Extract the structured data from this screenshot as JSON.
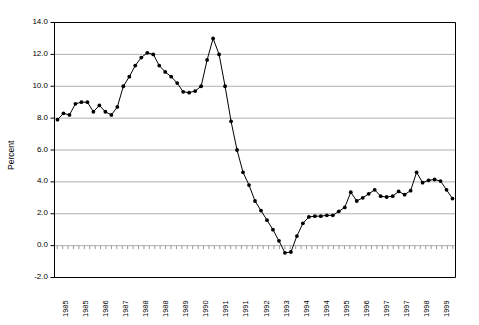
{
  "chart_data": {
    "type": "line",
    "title": "",
    "subtitle": "",
    "xlabel": "",
    "ylabel": "Percent",
    "ylim": [
      -2.0,
      14.0
    ],
    "yticks": [
      -2.0,
      0.0,
      2.0,
      4.0,
      6.0,
      8.0,
      10.0,
      12.0,
      14.0
    ],
    "ytick_labels": [
      "-2.0",
      "0.0",
      "2.0",
      "4.0",
      "6.0",
      "8.0",
      "10.0",
      "12.0",
      "14.0"
    ],
    "grid": true,
    "grid_axis": "y",
    "legend": false,
    "legend_position": "none",
    "marker": "filled-circle",
    "line_color": "#000000",
    "marker_color": "#000000",
    "grid_color": "#b0b0b0",
    "axis_color": "#000000",
    "plot_background": "#ffffff",
    "xtick_labels": [
      "1985",
      "1985",
      "1986",
      "1987",
      "1988",
      "1988",
      "1989",
      "1990",
      "1991",
      "1991",
      "1992",
      "1993",
      "1994",
      "1994",
      "1995",
      "1996",
      "1997",
      "1997",
      "1998",
      "1999"
    ],
    "n_points": 60,
    "values": [
      7.9,
      8.3,
      8.2,
      8.9,
      9.0,
      9.0,
      8.4,
      8.8,
      8.4,
      8.2,
      8.7,
      10.0,
      10.6,
      11.3,
      11.8,
      12.1,
      12.0,
      11.3,
      10.9,
      10.6,
      10.2,
      9.65,
      9.6,
      9.7,
      10.0,
      11.65,
      13.0,
      12.0,
      10.0,
      7.8,
      6.0,
      4.6,
      3.8,
      2.8,
      2.2,
      1.6,
      1.0,
      0.3,
      -0.45,
      -0.4,
      0.6,
      1.4,
      1.8,
      1.85,
      1.85,
      1.9,
      1.9,
      2.15,
      2.4,
      3.35,
      2.8,
      3.0,
      3.25,
      3.5,
      3.1,
      3.05,
      3.1,
      3.4,
      3.2,
      3.45
    ],
    "extended_values": [
      4.6,
      3.95,
      4.1,
      4.15,
      4.05,
      3.5,
      2.95
    ],
    "series": [
      {
        "name": "Percent",
        "values": [
          7.9,
          8.3,
          8.2,
          8.9,
          9.0,
          9.0,
          8.4,
          8.8,
          8.4,
          8.2,
          8.7,
          10.0,
          10.6,
          11.3,
          11.8,
          12.1,
          12.0,
          11.3,
          10.9,
          10.6,
          10.2,
          9.65,
          9.6,
          9.7,
          10.0,
          11.65,
          13.0,
          12.0,
          10.0,
          7.8,
          6.0,
          4.6,
          3.8,
          2.8,
          2.2,
          1.6,
          1.0,
          0.3,
          -0.45,
          -0.4,
          0.6,
          1.4,
          1.8,
          1.85,
          1.85,
          1.9,
          1.9,
          2.15,
          2.4,
          3.35,
          2.8,
          3.0,
          3.25,
          3.5,
          3.1,
          3.05,
          3.1,
          3.4,
          3.2,
          3.45,
          4.6,
          3.95,
          4.1,
          4.15,
          4.05,
          3.5,
          2.95
        ]
      }
    ]
  }
}
